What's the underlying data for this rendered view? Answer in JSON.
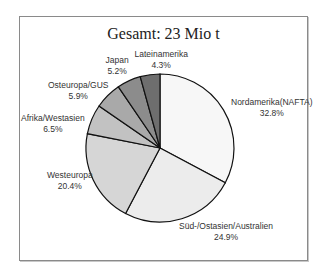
{
  "chart_data": {
    "type": "pie",
    "title": "Gesamt: 23 Mio t",
    "categories": [
      "Nordamerika(NAFTA)",
      "Süd-/Ostasien/Australien",
      "Westeuropa",
      "Afrika/Westasien",
      "Osteuropa/GUS",
      "Japan",
      "Lateinamerika"
    ],
    "values": [
      32.8,
      24.9,
      20.4,
      6.5,
      5.9,
      5.2,
      4.3
    ],
    "labels": [
      "32.8%",
      "24.9%",
      "20.4%",
      "6.5%",
      "5.9%",
      "5.2%",
      "4.3%"
    ],
    "colors": [
      "#f7f7f7",
      "#ececec",
      "#d6d6d6",
      "#c2c2c2",
      "#a9a9a9",
      "#8c8c8c",
      "#6e6e6e"
    ],
    "start_angle": "12 o'clock, clockwise",
    "legend": "none (direct labels)"
  }
}
